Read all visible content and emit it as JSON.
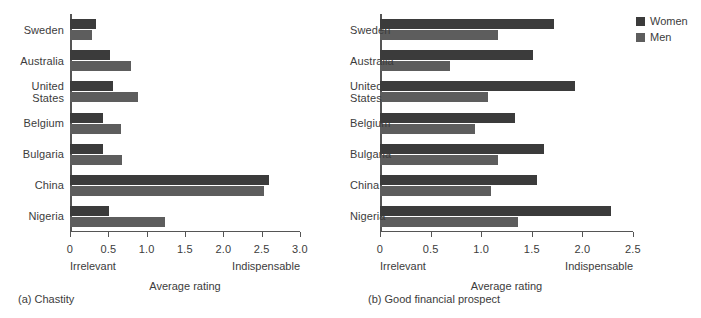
{
  "legend": {
    "position": "top-right",
    "entries": [
      {
        "label": "Women",
        "color": "#3b3b3b",
        "icon": "square-swatch-icon"
      },
      {
        "label": "Men",
        "color": "#5d5d5d",
        "icon": "square-swatch-icon"
      }
    ]
  },
  "captions": {
    "a": "(a) Chastity",
    "b": "(b) Good financial prospect"
  },
  "chart_data": [
    {
      "id": "a",
      "type": "bar",
      "orientation": "horizontal",
      "title": "(a) Chastity",
      "xlabel": "Average rating",
      "ylabel": "",
      "xlim": [
        0,
        3.0
      ],
      "xticks": [
        0,
        0.5,
        1.0,
        1.5,
        2.0,
        2.5,
        3.0
      ],
      "xticklabels": [
        "0",
        "0.5",
        "1.0",
        "1.5",
        "2.0",
        "2.5",
        "3.0"
      ],
      "scale_low_label": "Irrelevant",
      "scale_high_label": "Indispensable",
      "grid": false,
      "legend_position": "top-right",
      "categories": [
        "Sweden",
        "Australia",
        "United\nStates",
        "Belgium",
        "Bulgaria",
        "China",
        "Nigeria"
      ],
      "series": [
        {
          "name": "Women",
          "color": "#3b3b3b",
          "values": [
            0.34,
            0.52,
            0.56,
            0.43,
            0.43,
            2.6,
            0.51
          ]
        },
        {
          "name": "Men",
          "color": "#5d5d5d",
          "values": [
            0.29,
            0.8,
            0.89,
            0.66,
            0.68,
            2.53,
            1.24
          ]
        }
      ]
    },
    {
      "id": "b",
      "type": "bar",
      "orientation": "horizontal",
      "title": "(b) Good financial prospect",
      "xlabel": "Average rating",
      "ylabel": "",
      "xlim": [
        0,
        2.5
      ],
      "xticks": [
        0,
        0.5,
        1.0,
        1.5,
        2.0,
        2.5
      ],
      "xticklabels": [
        "0",
        "0.5",
        "1.0",
        "1.5",
        "2.0",
        "2.5"
      ],
      "scale_low_label": "Irrelevant",
      "scale_high_label": "Indispensable",
      "grid": false,
      "legend_position": "top-right",
      "categories": [
        "Sweden",
        "Australia",
        "United\nStates",
        "Belgium",
        "Bulgaria",
        "China",
        "Nigeria"
      ],
      "series": [
        {
          "name": "Women",
          "color": "#3b3b3b",
          "values": [
            1.72,
            1.51,
            1.93,
            1.33,
            1.62,
            1.55,
            2.28
          ]
        },
        {
          "name": "Men",
          "color": "#5d5d5d",
          "values": [
            1.17,
            0.69,
            1.07,
            0.94,
            1.17,
            1.1,
            1.36
          ]
        }
      ]
    }
  ]
}
